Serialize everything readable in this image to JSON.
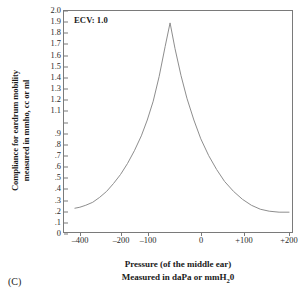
{
  "chart_data": {
    "type": "line",
    "title": "",
    "annotation": "ECV: 1.0",
    "xlabel_line1": "Pressure (of the middle ear)",
    "xlabel_line2_pre": "Measured in daPa or mmH",
    "xlabel_line2_sub": "2",
    "xlabel_line2_post": "0",
    "ylabel_line1": "Compliance for eardrum mobility",
    "ylabel_line2": "measured in mmho, cc or ml",
    "xlim": [
      -450,
      225
    ],
    "ylim": [
      0,
      2.0
    ],
    "grid": false,
    "legend": null,
    "x_ticks": [
      {
        "value": -400,
        "label": "–400",
        "pos": 79
      },
      {
        "value": -200,
        "label": "–200",
        "pos": 120
      },
      {
        "value": -100,
        "label": "–100",
        "pos": 147
      },
      {
        "value": 0,
        "label": "0",
        "pos": 200
      },
      {
        "value": 100,
        "label": "+100",
        "pos": 243
      },
      {
        "value": 200,
        "label": "+200",
        "pos": 288
      }
    ],
    "y_ticks": [
      {
        "value": 2.0,
        "label": "2.0"
      },
      {
        "value": 1.9,
        "label": "1.9"
      },
      {
        "value": 1.8,
        "label": "1.8"
      },
      {
        "value": 1.7,
        "label": "1.7"
      },
      {
        "value": 1.6,
        "label": "1.6"
      },
      {
        "value": 1.5,
        "label": "1.5"
      },
      {
        "value": 1.4,
        "label": "1.4"
      },
      {
        "value": 1.3,
        "label": "1.3"
      },
      {
        "value": 1.2,
        "label": "1.2"
      },
      {
        "value": 1.1,
        "label": "1.1"
      },
      {
        "value": 1.0,
        "label": ""
      },
      {
        "value": 0.9,
        "label": ".9"
      },
      {
        "value": 0.8,
        "label": ".8"
      },
      {
        "value": 0.7,
        "label": ".7"
      },
      {
        "value": 0.6,
        "label": ".6"
      },
      {
        "value": 0.5,
        "label": ".5"
      },
      {
        "value": 0.4,
        "label": ".4"
      },
      {
        "value": 0.3,
        "label": ".3"
      },
      {
        "value": 0.2,
        "label": ".2"
      },
      {
        "value": 0.1,
        "label": ".1"
      },
      {
        "value": 0.0,
        "label": "0"
      }
    ],
    "series": [
      {
        "name": "tympanogram",
        "color": "#8c8c8c",
        "points": [
          [
            74,
            209
          ],
          [
            79,
            208
          ],
          [
            85,
            206
          ],
          [
            92,
            203
          ],
          [
            99,
            198
          ],
          [
            106,
            192
          ],
          [
            113,
            184
          ],
          [
            120,
            175
          ],
          [
            127,
            164
          ],
          [
            134,
            151
          ],
          [
            141,
            136
          ],
          [
            147,
            120
          ],
          [
            153,
            101
          ],
          [
            159,
            76
          ],
          [
            165,
            46
          ],
          [
            170,
            22
          ],
          [
            175,
            48
          ],
          [
            181,
            75
          ],
          [
            187,
            98
          ],
          [
            194,
            120
          ],
          [
            201,
            139
          ],
          [
            209,
            156
          ],
          [
            217,
            170
          ],
          [
            225,
            182
          ],
          [
            234,
            192
          ],
          [
            243,
            200
          ],
          [
            252,
            206
          ],
          [
            261,
            210
          ],
          [
            270,
            212
          ],
          [
            280,
            213
          ],
          [
            290,
            213
          ]
        ]
      }
    ],
    "caption": "(C)",
    "plot_area": {
      "left": 63,
      "top": 10,
      "width": 230,
      "height": 223
    },
    "axis_color": "#7a7a7a",
    "curve_color": "#8c8c8c"
  }
}
